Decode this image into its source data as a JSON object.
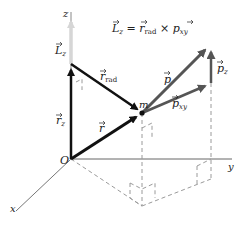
{
  "diagram": {
    "equation": {
      "lhs": "L",
      "lhs_sub": "z",
      "eq": " = ",
      "r": "r",
      "r_sub": "rad",
      "times": " × ",
      "p": "p",
      "p_sub": "xy"
    },
    "axes": {
      "x": "x",
      "y": "y",
      "z": "z",
      "origin": "O"
    },
    "vectors": {
      "Lz": {
        "sym": "L",
        "sub": "z"
      },
      "r_z": {
        "sym": "r",
        "sub": "z"
      },
      "r_rad": {
        "sym": "r",
        "sub": "rad"
      },
      "r": {
        "sym": "r"
      },
      "p": {
        "sym": "p"
      },
      "p_xy": {
        "sym": "p",
        "sub": "xy"
      },
      "p_z": {
        "sym": "p",
        "sub": "z"
      }
    },
    "mass_label": "m",
    "colors": {
      "dark": "#111111",
      "grey": "#555555",
      "light": "#cfcfcf",
      "dash": "#9a9a9a",
      "axis": "#666666"
    }
  }
}
